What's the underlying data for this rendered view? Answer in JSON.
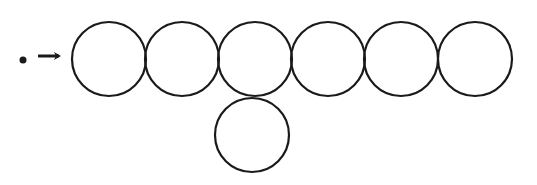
{
  "diagram": {
    "stroke_color": "#1a1a1a",
    "background": "#ffffff",
    "start_marker": {
      "type": "dot",
      "cx": 23,
      "cy": 60,
      "r": 3.5
    },
    "arrow": {
      "x1": 38,
      "y1": 56,
      "x2": 63,
      "y2": 56
    },
    "circle_radius": 37,
    "top_row": [
      {
        "cx": 109,
        "cy": 59
      },
      {
        "cx": 182,
        "cy": 59
      },
      {
        "cx": 255,
        "cy": 59
      },
      {
        "cx": 328,
        "cy": 59
      },
      {
        "cx": 401,
        "cy": 59
      },
      {
        "cx": 475,
        "cy": 59
      }
    ],
    "branch": [
      {
        "cx": 252,
        "cy": 135
      }
    ]
  }
}
